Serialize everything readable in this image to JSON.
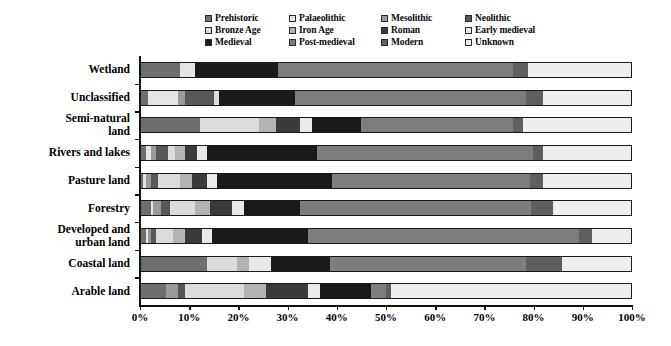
{
  "chart_data": {
    "type": "bar",
    "orientation": "horizontal",
    "stacked": true,
    "normalized_percent": true,
    "title": "",
    "subtitle": "",
    "xlabel": "",
    "ylabel": "",
    "xlim": [
      0,
      100
    ],
    "grid": false,
    "legend_position": "top",
    "xticks": [
      "0%",
      "10%",
      "20%",
      "30%",
      "40%",
      "50%",
      "60%",
      "70%",
      "80%",
      "90%",
      "100%"
    ],
    "xtick_values": [
      0,
      10,
      20,
      30,
      40,
      50,
      60,
      70,
      80,
      90,
      100
    ],
    "categories": [
      "Wetland",
      "Unclassified",
      "Semi-natural\nland",
      "Rivers and lakes",
      "Pasture land",
      "Forestry",
      "Developed and\nurban land",
      "Coastal land",
      "Arable land"
    ],
    "series": [
      {
        "name": "Prehistoric",
        "color": "#6e6e6e",
        "values": [
          8.0,
          1.5,
          12.0,
          1.0,
          0.5,
          2.0,
          1.0,
          13.5,
          5.0
        ]
      },
      {
        "name": "Palaeolithic",
        "color": "#e4e4e4",
        "values": [
          3.0,
          6.0,
          0.0,
          1.0,
          0.5,
          0.5,
          0.5,
          0.0,
          0.0
        ]
      },
      {
        "name": "Mesolithic",
        "color": "#9a9a9a",
        "values": [
          0.0,
          1.5,
          0.0,
          1.0,
          1.0,
          1.5,
          0.5,
          0.0,
          2.5
        ]
      },
      {
        "name": "Neolithic",
        "color": "#585858",
        "values": [
          0.0,
          6.0,
          0.0,
          2.5,
          1.5,
          2.0,
          1.0,
          0.0,
          1.5
        ]
      },
      {
        "name": "Bronze Age",
        "color": "#dcdcdc",
        "values": [
          0.0,
          1.0,
          12.0,
          1.5,
          4.5,
          5.0,
          3.5,
          6.0,
          12.0
        ]
      },
      {
        "name": "Iron Age",
        "color": "#b4b4b4",
        "values": [
          0.0,
          0.0,
          3.5,
          2.0,
          2.5,
          3.0,
          2.5,
          2.5,
          4.5
        ]
      },
      {
        "name": "Roman",
        "color": "#3a3a3a",
        "values": [
          0.0,
          0.0,
          5.0,
          2.5,
          3.0,
          4.5,
          3.5,
          0.0,
          8.5
        ]
      },
      {
        "name": "Early medieval",
        "color": "#e9e9e9",
        "values": [
          0.0,
          0.0,
          2.5,
          2.0,
          2.0,
          2.5,
          2.0,
          4.5,
          2.5
        ]
      },
      {
        "name": "Medieval",
        "color": "#1a1a1a",
        "values": [
          17.0,
          15.5,
          10.0,
          22.5,
          23.5,
          11.5,
          19.5,
          12.0,
          10.5
        ]
      },
      {
        "name": "Post-medieval",
        "color": "#7d7d7d",
        "values": [
          48.0,
          47.0,
          31.0,
          44.0,
          40.5,
          47.0,
          55.5,
          40.0,
          3.0
        ]
      },
      {
        "name": "Modern",
        "color": "#5f5f5f",
        "values": [
          3.0,
          3.5,
          2.0,
          2.0,
          2.5,
          4.5,
          2.5,
          7.5,
          1.0
        ]
      },
      {
        "name": "Unknown",
        "color": "#eeeeee",
        "values": [
          21.0,
          18.0,
          22.0,
          18.0,
          18.0,
          16.0,
          8.0,
          14.0,
          49.0
        ]
      }
    ]
  },
  "legend": {
    "items": [
      {
        "label": "Prehistoric",
        "color": "#6e6e6e"
      },
      {
        "label": "Palaeolithic",
        "color": "#e4e4e4"
      },
      {
        "label": "Mesolithic",
        "color": "#9a9a9a"
      },
      {
        "label": "Neolithic",
        "color": "#585858"
      },
      {
        "label": "Bronze Age",
        "color": "#dcdcdc"
      },
      {
        "label": "Iron Age",
        "color": "#b4b4b4"
      },
      {
        "label": "Roman",
        "color": "#3a3a3a"
      },
      {
        "label": "Early medieval",
        "color": "#e9e9e9"
      },
      {
        "label": "Medieval",
        "color": "#1a1a1a"
      },
      {
        "label": "Post-medieval",
        "color": "#7d7d7d"
      },
      {
        "label": "Modern",
        "color": "#5f5f5f"
      },
      {
        "label": "Unknown",
        "color": "#eeeeee"
      }
    ]
  },
  "colors": {
    "axis": "#111111",
    "bar_border": "#1a1a1a",
    "background": "#ffffff",
    "text": "#000000"
  }
}
